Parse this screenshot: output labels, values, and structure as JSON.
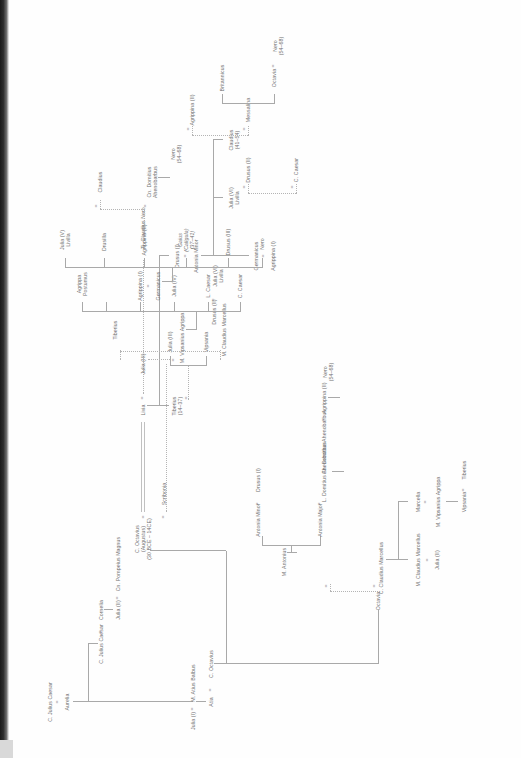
{
  "document": {
    "kind": "genealogical-chart",
    "title": "Julio-Claudian family tree",
    "orientation": "rotated-90-ccw",
    "colors": {
      "text": "#6f6f6f",
      "rule": "#a9a9a9",
      "gutter": "#1b1b1b",
      "page": "#fefefe"
    }
  },
  "marriage_symbol": "=",
  "persons": {
    "c_julius_caesar_sr": {
      "name": "C. Julius Caesar"
    },
    "aurelia": {
      "name": "Aurelia"
    },
    "julia_i": {
      "name": "Julia (I)"
    },
    "m_atius_balbus": {
      "name": "M. Atius Balbus"
    },
    "atia": {
      "name": "Atia"
    },
    "c_octavius_sr": {
      "name": "C. Octavius"
    },
    "c_julius_caesar": {
      "name": "C. Julius Caesar"
    },
    "cornelia": {
      "name": "Cornelia"
    },
    "julia_ii": {
      "name": "Julia (II)"
    },
    "cn_pompeius_magnus": {
      "name": "Cn. Pompeius Magnus"
    },
    "augustus": {
      "name": "C. Octavius",
      "alt": "(Augustus)",
      "dates": "(30 BCE – 14CE)"
    },
    "scribonia": {
      "name": "Scribonia"
    },
    "livia": {
      "name": "Livia"
    },
    "ti_claudius_nero": {
      "name": "Ti. Claudius Nero"
    },
    "octavia": {
      "name": "Octavia"
    },
    "c_claudius_marcellus": {
      "name": "C. Claudius Marcellus"
    },
    "m_antonius": {
      "name": "M. Antonius"
    },
    "m_claudius_marcellus_a": {
      "name": "M. Claudius Marcellus"
    },
    "marcella": {
      "name": "Marcella"
    },
    "m_vipsanius_agrippa_a": {
      "name": "M. Vipsanius Agrippa"
    },
    "julia_iii_a": {
      "name": "Julia (II)"
    },
    "vipsania_a": {
      "name": "Vipsania"
    },
    "tiberius_a": {
      "name": "Tiberius"
    },
    "antonia_major": {
      "name": "Antonia Major"
    },
    "antonia_minor": {
      "name": "Antonia Minor"
    },
    "drusus_i": {
      "name": "Drusus (I)"
    },
    "l_domitius_ahenobarbus": {
      "name": "L. Domitius Ahenobarbus"
    },
    "cn_domitius_ahenobarbus_a": {
      "name": "Cn. Domitius Ahenobarbus"
    },
    "agrippina_ii_a": {
      "name": "Agrippina (II)"
    },
    "nero_a": {
      "name": "Nero",
      "dates": "(54–68)"
    },
    "tiberius": {
      "name": "Tiberius",
      "dates": "(14–37)"
    },
    "julia_iii_t": {
      "name": "Julia (III)"
    },
    "vipsania": {
      "name": "Vipsania"
    },
    "drusus_ii_t": {
      "name": "Drusus (II)"
    },
    "julia_vi_livilla_t": {
      "name": "Julia (VI)",
      "alt": "Livilla"
    },
    "germanicus_top": {
      "name": "Germanicus"
    },
    "agrippina_i_top": {
      "name": "Agrippina (I)"
    },
    "julia_vi_livilla": {
      "name": "Julia (VI)",
      "alt": "Livilla"
    },
    "claudius": {
      "name": "Claudius",
      "dates": "(41–54)"
    },
    "c_caesar_top": {
      "name": "C. Caesar"
    },
    "drusus_ii": {
      "name": "Drusus (II)"
    },
    "messalina": {
      "name": "Messalina"
    },
    "agrippina_ii_top": {
      "name": "Agrippina (II)"
    },
    "octavia_c": {
      "name": "Octavia"
    },
    "britannicus": {
      "name": "Britannicus"
    },
    "nero_top": {
      "name": "Nero",
      "dates": "(54–68)"
    },
    "julia_iii": {
      "name": "Julia (III)"
    },
    "m_claudius_marcellus": {
      "name": "M. Claudius Marcellus"
    },
    "m_vipsanius_agrippa": {
      "name": "M. Vipsanius Agrippa"
    },
    "tiberius_sp": {
      "name": "Tiberius"
    },
    "c_caesar": {
      "name": "C. Caesar"
    },
    "l_caesar": {
      "name": "L. Caesar"
    },
    "julia_iv": {
      "name": "Julia (IV)"
    },
    "agrippina_i": {
      "name": "Agrippina (I)"
    },
    "agrippa_postumus": {
      "name": "Agrippa",
      "alt": "Postumus"
    },
    "germanicus": {
      "name": "Germanicus"
    },
    "nero_g": {
      "name": "Nero"
    },
    "drusus_iii": {
      "name": "Drusus (III)"
    },
    "gaius_caligula": {
      "name": "Gaius",
      "alt": "(Caligula)",
      "dates": "(37–41)"
    },
    "agrippina_ii": {
      "name": "Agrippina (II)"
    },
    "drusilla": {
      "name": "Drusilla"
    },
    "julia_v_livilla": {
      "name": "Julia (V)",
      "alt": "Livilla"
    },
    "claudius_sp": {
      "name": "Claudius"
    },
    "cn_domitius_ahenobarbus": {
      "name": "Cn. Domitius",
      "alt": "Ahenobarbus"
    },
    "nero": {
      "name": "Nero",
      "dates": "(54–68)"
    }
  }
}
